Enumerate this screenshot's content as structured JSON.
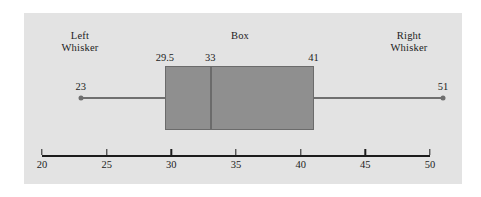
{
  "chart_data": {
    "type": "box",
    "title": "",
    "xlabel": "",
    "ylabel": "",
    "orientation": "horizontal",
    "xlim": [
      20,
      50
    ],
    "grid": false,
    "axis_ticks": [
      20,
      25,
      30,
      35,
      40,
      45,
      50
    ],
    "axis_tick_labels": [
      "20",
      "25",
      "30",
      "35",
      "40",
      "45",
      "50"
    ],
    "box_stats": {
      "min": 23,
      "q1": 29.5,
      "median": 33,
      "q3": 41,
      "max": 51
    },
    "point_labels": {
      "min": "23",
      "q1": "29.5",
      "median": "33",
      "q3": "41",
      "max": "51"
    },
    "annotations": [
      {
        "text": "Left\nWhisker",
        "target": "min"
      },
      {
        "text": "Box",
        "target": "box"
      },
      {
        "text": "Right\nWhisker",
        "target": "max"
      }
    ]
  },
  "annotations": {
    "left_whisker": "Left\nWhisker",
    "box": "Box",
    "right_whisker": "Right\nWhisker"
  },
  "values": {
    "min": "23",
    "q1": "29.5",
    "median": "33",
    "q3": "41",
    "max": "51"
  },
  "axis": {
    "ticks": [
      "20",
      "25",
      "30",
      "35",
      "40",
      "45",
      "50"
    ]
  },
  "colors": {
    "panel_background": "#e3e3e3",
    "box_fill": "#8f8f8f",
    "box_stroke": "#6b6b6b",
    "whisker": "#707070",
    "axis": "#1c1c1c",
    "text": "#1c1c1c"
  }
}
